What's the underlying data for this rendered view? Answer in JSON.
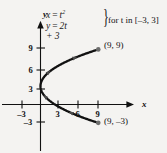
{
  "figure": {
    "background_color": "#f4f3f1",
    "ink_color": "#111111"
  },
  "equation": {
    "line1_lhs": "x",
    "line1_eq": "=",
    "line1_base": "t",
    "line1_exp": "2",
    "line2_lhs": "y",
    "line2_eq": "=",
    "line2_rhs": "2t + 3",
    "brace": "}",
    "domain_text": "for t in [–3, 3]"
  },
  "axes": {
    "x_axis_label": "x",
    "y_axis_label": "y",
    "x_ticks": [
      {
        "label": "–3",
        "value": -3,
        "px": 22
      },
      {
        "label": "3",
        "value": 3,
        "px": 58
      },
      {
        "label": "6",
        "value": 6,
        "px": 78
      },
      {
        "label": "9",
        "value": 9,
        "px": 98
      }
    ],
    "y_ticks": [
      {
        "label": "9",
        "value": 9,
        "px": 48
      },
      {
        "label": "6",
        "value": 6,
        "px": 70
      },
      {
        "label": "3",
        "value": 3,
        "px": 89
      },
      {
        "label": "–3",
        "value": -3,
        "px": 122
      }
    ]
  },
  "annotations": {
    "endpoint_upper": "(9, 9)",
    "endpoint_lower": "(9, –3)"
  },
  "chart_data": {
    "type": "line",
    "title": "",
    "subtitle": "",
    "xlabel": "x",
    "ylabel": "y",
    "xlim": [
      -5,
      12
    ],
    "ylim": [
      -5,
      12
    ],
    "grid": false,
    "legend": null,
    "parametric": {
      "x_equation": "x = t^2",
      "y_equation": "y = 2t + 3",
      "parameter": "t",
      "t_min": -3,
      "t_max": 3
    },
    "series": [
      {
        "name": "x = t^2, y = 2t + 3",
        "color": "#111111",
        "points": [
          {
            "t": -3,
            "x": 9,
            "y": -3
          },
          {
            "t": -2.5,
            "x": 6.25,
            "y": -2
          },
          {
            "t": -2,
            "x": 4,
            "y": -1
          },
          {
            "t": -1.5,
            "x": 2.25,
            "y": 0
          },
          {
            "t": -1,
            "x": 1,
            "y": 1
          },
          {
            "t": -0.5,
            "x": 0.25,
            "y": 2
          },
          {
            "t": 0,
            "x": 0,
            "y": 3
          },
          {
            "t": 0.5,
            "x": 0.25,
            "y": 4
          },
          {
            "t": 1,
            "x": 1,
            "y": 5
          },
          {
            "t": 1.5,
            "x": 2.25,
            "y": 6
          },
          {
            "t": 2,
            "x": 4,
            "y": 7
          },
          {
            "t": 2.5,
            "x": 6.25,
            "y": 8
          },
          {
            "t": 3,
            "x": 9,
            "y": 9
          }
        ]
      }
    ],
    "annotated_points": [
      {
        "label": "(9, 9)",
        "x": 9,
        "y": 9
      },
      {
        "label": "(9, –3)",
        "x": 9,
        "y": -3
      }
    ],
    "direction_arrows": [
      {
        "t": -2.2,
        "note": "arrow along lower branch toward (9, -3)"
      },
      {
        "t": -0.9,
        "note": "arrow along lower branch"
      },
      {
        "t": 1.1,
        "note": "arrow along upper branch"
      },
      {
        "t": 2.3,
        "note": "arrow along upper branch toward (9, 9)"
      }
    ]
  }
}
